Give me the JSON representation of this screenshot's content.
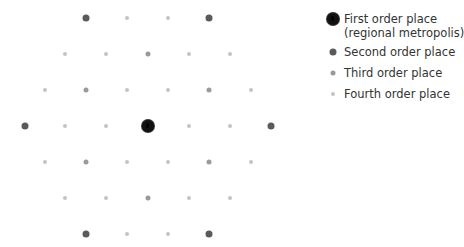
{
  "legend": {
    "items": [
      {
        "order": 1,
        "label": "First order place",
        "label2": "(regional metropolis)",
        "color": "#111111"
      },
      {
        "order": 2,
        "label": "Second order place",
        "color": "#5a5a5a"
      },
      {
        "order": 3,
        "label": "Third order place",
        "color": "#9a9a9a"
      },
      {
        "order": 4,
        "label": "Fourth order place",
        "color": "#c4c4c4"
      }
    ]
  },
  "diagram": {
    "rows": [
      {
        "y": 18,
        "places": [
          [
            86,
            2
          ],
          [
            127,
            4
          ],
          [
            168,
            4
          ],
          [
            209,
            2
          ]
        ]
      },
      {
        "y": 54,
        "places": [
          [
            65,
            4
          ],
          [
            106,
            4
          ],
          [
            148,
            3
          ],
          [
            189,
            4
          ],
          [
            230,
            4
          ]
        ]
      },
      {
        "y": 90,
        "places": [
          [
            45,
            4
          ],
          [
            86,
            3
          ],
          [
            127,
            4
          ],
          [
            168,
            4
          ],
          [
            209,
            3
          ],
          [
            251,
            4
          ]
        ]
      },
      {
        "y": 126,
        "places": [
          [
            25,
            2
          ],
          [
            65,
            4
          ],
          [
            106,
            4
          ],
          [
            148,
            1
          ],
          [
            189,
            4
          ],
          [
            230,
            4
          ],
          [
            271,
            2
          ]
        ]
      },
      {
        "y": 162,
        "places": [
          [
            45,
            4
          ],
          [
            86,
            3
          ],
          [
            127,
            4
          ],
          [
            168,
            4
          ],
          [
            209,
            3
          ],
          [
            251,
            4
          ]
        ]
      },
      {
        "y": 198,
        "places": [
          [
            65,
            4
          ],
          [
            106,
            4
          ],
          [
            148,
            3
          ],
          [
            189,
            4
          ],
          [
            230,
            4
          ]
        ]
      },
      {
        "y": 234,
        "places": [
          [
            86,
            2
          ],
          [
            127,
            4
          ],
          [
            168,
            4
          ],
          [
            209,
            2
          ]
        ]
      }
    ]
  }
}
